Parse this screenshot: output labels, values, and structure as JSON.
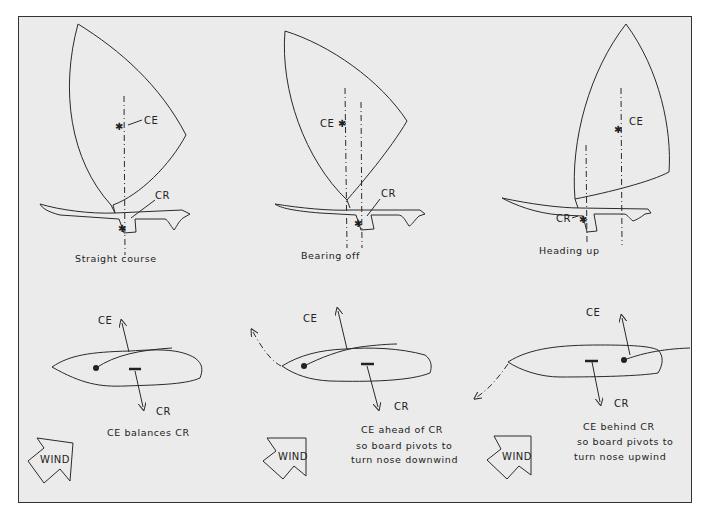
{
  "figure": {
    "panels": [
      {
        "id": "straight",
        "title": "Straight course",
        "sail_labels": {
          "ce": "CE",
          "cr": "CR"
        },
        "top_view": {
          "ce_label": "CE",
          "cr_label": "CR",
          "caption_lines": [
            "CE balances CR"
          ]
        },
        "wind_label": "WIND"
      },
      {
        "id": "bearing-off",
        "title": "Bearing off",
        "sail_labels": {
          "ce": "CE",
          "cr": "CR"
        },
        "top_view": {
          "ce_label": "CE",
          "cr_label": "CR",
          "caption_lines": [
            "CE ahead of CR",
            "so board pivots to",
            "turn nose downwind"
          ]
        },
        "wind_label": "WIND"
      },
      {
        "id": "heading-up",
        "title": "Heading up",
        "sail_labels": {
          "ce": "CE",
          "cr": "CR"
        },
        "top_view": {
          "ce_label": "CE",
          "cr_label": "CR",
          "caption_lines": [
            "CE behind CR",
            "so board pivots to",
            "turn nose upwind"
          ]
        },
        "wind_label": "WIND"
      }
    ],
    "colors": {
      "background": "#ebebeb",
      "ink": "#2a2a2a",
      "page": "#ffffff"
    }
  }
}
